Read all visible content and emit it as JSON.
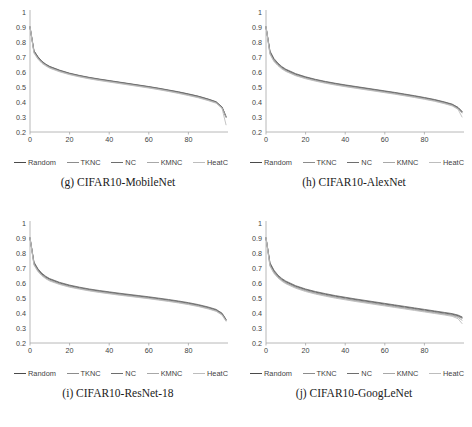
{
  "figure": {
    "panels": [
      {
        "id": "g",
        "caption": "(g) CIFAR10-MobileNet",
        "chart_ref": 0
      },
      {
        "id": "h",
        "caption": "(h) CIFAR10-AlexNet",
        "chart_ref": 1
      },
      {
        "id": "i",
        "caption": "(i) CIFAR10-ResNet-18",
        "chart_ref": 2
      },
      {
        "id": "j",
        "caption": "(j) CIFAR10-GoogLeNet",
        "chart_ref": 3
      }
    ],
    "legend_entries": [
      {
        "label": "Random",
        "color": "#4a4a4a"
      },
      {
        "label": "TKNC",
        "color": "#8c8c8c"
      },
      {
        "label": "NC",
        "color": "#6e6e6e"
      },
      {
        "label": "KMNC",
        "color": "#a8a8a8"
      },
      {
        "label": "HeatC",
        "color": "#bdbdbd"
      }
    ]
  },
  "chart_data": [
    {
      "type": "line",
      "title": "(g) CIFAR10-MobileNet",
      "xlabel": "",
      "ylabel": "",
      "xlim": [
        0,
        100
      ],
      "ylim": [
        0.2,
        1.0
      ],
      "grid": false,
      "yticks": [
        0.2,
        0.3,
        0.4,
        0.5,
        0.6,
        0.7,
        0.8,
        0.9,
        1
      ],
      "ytick_labels": [
        "0.2",
        "0.3",
        "0.4",
        "0.5",
        "0.6",
        "0.7",
        "0.8",
        "0.9",
        "1"
      ],
      "xticks": [
        0,
        20,
        40,
        60,
        80
      ],
      "xtick_labels": [
        "0",
        "20",
        "40",
        "60",
        "80"
      ],
      "x": [
        0,
        2,
        4,
        6,
        8,
        10,
        15,
        20,
        25,
        30,
        35,
        40,
        45,
        50,
        55,
        60,
        65,
        70,
        75,
        80,
        85,
        90,
        94,
        97,
        99
      ],
      "series": [
        {
          "name": "Random",
          "color": "#4a4a4a",
          "values": [
            0.9,
            0.74,
            0.7,
            0.67,
            0.65,
            0.635,
            0.61,
            0.59,
            0.575,
            0.562,
            0.551,
            0.541,
            0.531,
            0.521,
            0.511,
            0.501,
            0.49,
            0.478,
            0.466,
            0.452,
            0.437,
            0.418,
            0.4,
            0.365,
            0.3
          ]
        },
        {
          "name": "TKNC",
          "color": "#8c8c8c",
          "values": [
            0.9,
            0.735,
            0.695,
            0.665,
            0.648,
            0.632,
            0.607,
            0.588,
            0.573,
            0.56,
            0.549,
            0.539,
            0.529,
            0.519,
            0.509,
            0.498,
            0.487,
            0.475,
            0.462,
            0.448,
            0.433,
            0.414,
            0.397,
            0.362,
            0.3
          ]
        },
        {
          "name": "NC",
          "color": "#6e6e6e",
          "values": [
            0.9,
            0.742,
            0.702,
            0.672,
            0.652,
            0.637,
            0.612,
            0.592,
            0.577,
            0.564,
            0.553,
            0.543,
            0.533,
            0.523,
            0.513,
            0.503,
            0.492,
            0.48,
            0.468,
            0.454,
            0.439,
            0.42,
            0.402,
            0.367,
            0.305
          ]
        },
        {
          "name": "KMNC",
          "color": "#a8a8a8",
          "values": [
            0.9,
            0.73,
            0.69,
            0.662,
            0.644,
            0.628,
            0.604,
            0.585,
            0.57,
            0.557,
            0.546,
            0.536,
            0.526,
            0.516,
            0.506,
            0.496,
            0.485,
            0.473,
            0.46,
            0.446,
            0.431,
            0.412,
            0.395,
            0.36,
            0.298
          ]
        },
        {
          "name": "HeatC",
          "color": "#bdbdbd",
          "values": [
            0.9,
            0.726,
            0.686,
            0.658,
            0.64,
            0.625,
            0.601,
            0.582,
            0.567,
            0.554,
            0.543,
            0.533,
            0.523,
            0.513,
            0.503,
            0.493,
            0.482,
            0.47,
            0.457,
            0.443,
            0.428,
            0.409,
            0.392,
            0.357,
            0.248
          ]
        }
      ]
    },
    {
      "type": "line",
      "title": "(h) CIFAR10-AlexNet",
      "xlabel": "",
      "ylabel": "",
      "xlim": [
        0,
        100
      ],
      "ylim": [
        0.2,
        1.0
      ],
      "grid": false,
      "yticks": [
        0.2,
        0.3,
        0.4,
        0.5,
        0.6,
        0.7,
        0.8,
        0.9,
        1
      ],
      "ytick_labels": [
        "0.2",
        "0.3",
        "0.4",
        "0.5",
        "0.6",
        "0.7",
        "0.8",
        "0.9",
        "1"
      ],
      "xticks": [
        0,
        20,
        40,
        60,
        80
      ],
      "xtick_labels": [
        "0",
        "20",
        "40",
        "60",
        "80"
      ],
      "x": [
        0,
        2,
        4,
        6,
        8,
        10,
        15,
        20,
        25,
        30,
        35,
        40,
        45,
        50,
        55,
        60,
        65,
        70,
        75,
        80,
        85,
        90,
        94,
        97,
        99
      ],
      "series": [
        {
          "name": "Random",
          "color": "#4a4a4a",
          "values": [
            0.9,
            0.735,
            0.685,
            0.655,
            0.632,
            0.615,
            0.585,
            0.565,
            0.548,
            0.534,
            0.522,
            0.511,
            0.501,
            0.491,
            0.481,
            0.471,
            0.461,
            0.45,
            0.439,
            0.427,
            0.414,
            0.398,
            0.383,
            0.362,
            0.335
          ]
        },
        {
          "name": "TKNC",
          "color": "#8c8c8c",
          "values": [
            0.9,
            0.728,
            0.678,
            0.65,
            0.627,
            0.61,
            0.581,
            0.561,
            0.545,
            0.531,
            0.519,
            0.508,
            0.498,
            0.488,
            0.478,
            0.468,
            0.458,
            0.447,
            0.436,
            0.424,
            0.411,
            0.395,
            0.38,
            0.358,
            0.33
          ]
        },
        {
          "name": "NC",
          "color": "#6e6e6e",
          "values": [
            0.9,
            0.74,
            0.69,
            0.66,
            0.636,
            0.619,
            0.589,
            0.568,
            0.551,
            0.537,
            0.525,
            0.514,
            0.504,
            0.494,
            0.484,
            0.474,
            0.464,
            0.453,
            0.442,
            0.43,
            0.417,
            0.401,
            0.386,
            0.364,
            0.337
          ]
        },
        {
          "name": "KMNC",
          "color": "#a8a8a8",
          "values": [
            0.9,
            0.722,
            0.674,
            0.646,
            0.624,
            0.607,
            0.578,
            0.558,
            0.542,
            0.528,
            0.516,
            0.505,
            0.495,
            0.485,
            0.475,
            0.465,
            0.455,
            0.444,
            0.433,
            0.421,
            0.408,
            0.392,
            0.377,
            0.355,
            0.327
          ]
        },
        {
          "name": "HeatC",
          "color": "#bdbdbd",
          "values": [
            0.9,
            0.718,
            0.67,
            0.642,
            0.62,
            0.604,
            0.575,
            0.555,
            0.539,
            0.525,
            0.513,
            0.502,
            0.492,
            0.482,
            0.472,
            0.462,
            0.452,
            0.441,
            0.43,
            0.418,
            0.405,
            0.389,
            0.374,
            0.351,
            0.3
          ]
        }
      ]
    },
    {
      "type": "line",
      "title": "(i) CIFAR10-ResNet-18",
      "xlabel": "",
      "ylabel": "",
      "xlim": [
        0,
        100
      ],
      "ylim": [
        0.2,
        1.0
      ],
      "grid": false,
      "yticks": [
        0.2,
        0.3,
        0.4,
        0.5,
        0.6,
        0.7,
        0.8,
        0.9,
        1
      ],
      "ytick_labels": [
        "0.2",
        "0.3",
        "0.4",
        "0.5",
        "0.6",
        "0.7",
        "0.8",
        "0.9",
        "1"
      ],
      "xticks": [
        0,
        20,
        40,
        60,
        80
      ],
      "xtick_labels": [
        "0",
        "20",
        "40",
        "60",
        "80"
      ],
      "x": [
        0,
        2,
        4,
        6,
        8,
        10,
        15,
        20,
        25,
        30,
        35,
        40,
        45,
        50,
        55,
        60,
        65,
        70,
        75,
        80,
        85,
        90,
        94,
        97,
        99
      ],
      "series": [
        {
          "name": "Random",
          "color": "#4a4a4a",
          "values": [
            0.9,
            0.735,
            0.69,
            0.66,
            0.64,
            0.625,
            0.6,
            0.582,
            0.568,
            0.556,
            0.546,
            0.537,
            0.528,
            0.52,
            0.512,
            0.504,
            0.495,
            0.486,
            0.476,
            0.465,
            0.452,
            0.436,
            0.42,
            0.395,
            0.355
          ]
        },
        {
          "name": "TKNC",
          "color": "#8c8c8c",
          "values": [
            0.9,
            0.728,
            0.684,
            0.655,
            0.635,
            0.62,
            0.596,
            0.578,
            0.565,
            0.553,
            0.543,
            0.534,
            0.525,
            0.517,
            0.509,
            0.501,
            0.492,
            0.483,
            0.473,
            0.462,
            0.449,
            0.433,
            0.417,
            0.392,
            0.352
          ]
        },
        {
          "name": "NC",
          "color": "#6e6e6e",
          "values": [
            0.9,
            0.74,
            0.695,
            0.665,
            0.644,
            0.629,
            0.604,
            0.586,
            0.572,
            0.56,
            0.55,
            0.541,
            0.532,
            0.524,
            0.516,
            0.508,
            0.499,
            0.49,
            0.48,
            0.469,
            0.456,
            0.44,
            0.424,
            0.399,
            0.358
          ]
        },
        {
          "name": "KMNC",
          "color": "#a8a8a8",
          "values": [
            0.9,
            0.724,
            0.68,
            0.652,
            0.632,
            0.617,
            0.593,
            0.575,
            0.562,
            0.55,
            0.54,
            0.531,
            0.522,
            0.514,
            0.506,
            0.498,
            0.489,
            0.48,
            0.47,
            0.459,
            0.446,
            0.43,
            0.414,
            0.389,
            0.349
          ]
        },
        {
          "name": "HeatC",
          "color": "#bdbdbd",
          "values": [
            0.9,
            0.72,
            0.676,
            0.648,
            0.628,
            0.613,
            0.59,
            0.572,
            0.559,
            0.547,
            0.537,
            0.528,
            0.519,
            0.511,
            0.503,
            0.495,
            0.486,
            0.477,
            0.467,
            0.456,
            0.443,
            0.427,
            0.411,
            0.386,
            0.345
          ]
        }
      ]
    },
    {
      "type": "line",
      "title": "(j) CIFAR10-GoogLeNet",
      "xlabel": "",
      "ylabel": "",
      "xlim": [
        0,
        100
      ],
      "ylim": [
        0.2,
        1.0
      ],
      "grid": false,
      "yticks": [
        0.2,
        0.3,
        0.4,
        0.5,
        0.6,
        0.7,
        0.8,
        0.9,
        1
      ],
      "ytick_labels": [
        "0.2",
        "0.3",
        "0.4",
        "0.5",
        "0.6",
        "0.7",
        "0.8",
        "0.9",
        "1"
      ],
      "xticks": [
        0,
        20,
        40,
        60,
        80
      ],
      "xtick_labels": [
        "0",
        "20",
        "40",
        "60",
        "80"
      ],
      "x": [
        0,
        2,
        4,
        6,
        8,
        10,
        15,
        20,
        25,
        30,
        35,
        40,
        45,
        50,
        55,
        60,
        65,
        70,
        75,
        80,
        85,
        90,
        94,
        97,
        99
      ],
      "series": [
        {
          "name": "Random",
          "color": "#4a4a4a",
          "values": [
            0.9,
            0.73,
            0.68,
            0.648,
            0.625,
            0.608,
            0.578,
            0.556,
            0.539,
            0.525,
            0.512,
            0.501,
            0.49,
            0.48,
            0.47,
            0.46,
            0.45,
            0.44,
            0.43,
            0.42,
            0.41,
            0.4,
            0.392,
            0.382,
            0.37
          ]
        },
        {
          "name": "TKNC",
          "color": "#8c8c8c",
          "values": [
            0.9,
            0.722,
            0.673,
            0.642,
            0.62,
            0.603,
            0.573,
            0.551,
            0.534,
            0.52,
            0.507,
            0.496,
            0.485,
            0.475,
            0.465,
            0.455,
            0.445,
            0.435,
            0.425,
            0.415,
            0.405,
            0.395,
            0.387,
            0.377,
            0.365
          ]
        },
        {
          "name": "NC",
          "color": "#6e6e6e",
          "values": [
            0.9,
            0.736,
            0.686,
            0.653,
            0.63,
            0.613,
            0.582,
            0.56,
            0.543,
            0.529,
            0.516,
            0.505,
            0.494,
            0.484,
            0.474,
            0.464,
            0.454,
            0.444,
            0.434,
            0.424,
            0.414,
            0.404,
            0.396,
            0.386,
            0.374
          ]
        },
        {
          "name": "KMNC",
          "color": "#a8a8a8",
          "values": [
            0.9,
            0.716,
            0.668,
            0.638,
            0.616,
            0.599,
            0.569,
            0.547,
            0.53,
            0.516,
            0.503,
            0.492,
            0.481,
            0.471,
            0.461,
            0.451,
            0.441,
            0.431,
            0.421,
            0.411,
            0.401,
            0.391,
            0.383,
            0.371,
            0.352
          ]
        },
        {
          "name": "HeatC",
          "color": "#bdbdbd",
          "values": [
            0.9,
            0.712,
            0.664,
            0.634,
            0.612,
            0.595,
            0.565,
            0.543,
            0.526,
            0.512,
            0.499,
            0.488,
            0.477,
            0.467,
            0.457,
            0.447,
            0.437,
            0.427,
            0.417,
            0.407,
            0.397,
            0.387,
            0.378,
            0.362,
            0.33
          ]
        }
      ]
    }
  ]
}
